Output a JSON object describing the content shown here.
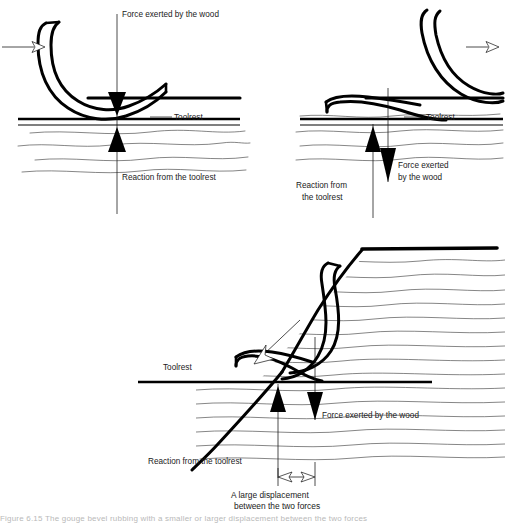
{
  "figure": {
    "caption": "Figure 6.15   The gouge bevel rubbing with a smaller or larger displacement between the two forces"
  },
  "panels": [
    {
      "id": "top-left",
      "name": "gouge-centred-on-toolrest",
      "labels": {
        "force": "Force exerted by the wood",
        "reaction": "Reaction from the toolrest",
        "toolrest": "Toolrest"
      }
    },
    {
      "id": "top-right",
      "name": "gouge-small-displacement",
      "labels": {
        "force_line1": "Force exerted",
        "force_line2": "by the wood",
        "reaction_line1": "Reaction from",
        "reaction_line2": "the toolrest",
        "toolrest": "Toolrest"
      }
    },
    {
      "id": "bottom",
      "name": "gouge-large-displacement",
      "labels": {
        "force": "Force exerted by the wood",
        "reaction": "Reaction from the toolrest",
        "toolrest": "Toolrest",
        "displacement_line1": "A large displacement",
        "displacement_line2": "between the two forces"
      }
    }
  ],
  "colors": {
    "ink": "#000000",
    "grain": "#3a3a3a",
    "caption": "#b9b9b9",
    "paper": "#ffffff"
  }
}
